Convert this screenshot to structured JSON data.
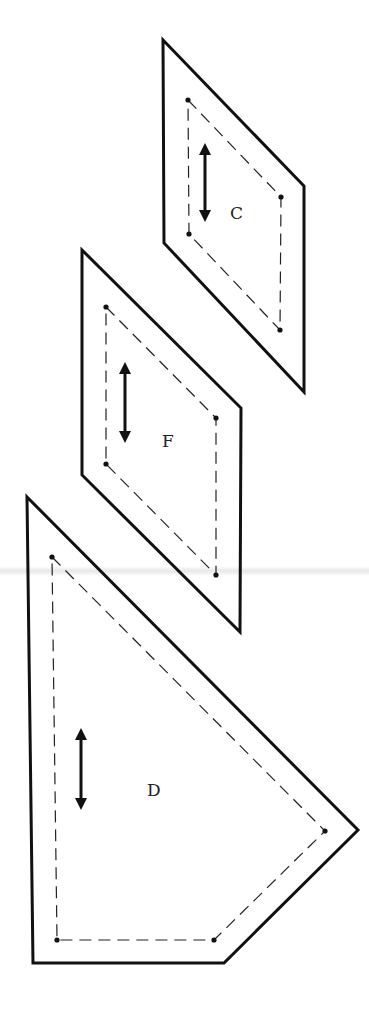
{
  "diagram": {
    "type": "quilt-pattern-templates",
    "background": "#ffffff",
    "line_color": "#111111",
    "pieces": [
      {
        "id": "C",
        "label": "C",
        "cut_line": [
          [
            163,
            40
          ],
          [
            304,
            186
          ],
          [
            304,
            392
          ],
          [
            164,
            243
          ]
        ],
        "seam_line": [
          [
            188,
            100
          ],
          [
            281,
            197
          ],
          [
            280,
            330
          ],
          [
            189,
            234
          ]
        ],
        "grain_arrow": {
          "x": 205,
          "y1": 143,
          "y2": 222
        },
        "label_pos": [
          230,
          219
        ]
      },
      {
        "id": "F",
        "label": "F",
        "cut_line": [
          [
            82,
            250
          ],
          [
            241,
            408
          ],
          [
            240,
            632
          ],
          [
            82,
            475
          ]
        ],
        "seam_line": [
          [
            106,
            307
          ],
          [
            216,
            418
          ],
          [
            216,
            575
          ],
          [
            106,
            464
          ]
        ],
        "grain_arrow": {
          "x": 125,
          "y1": 362,
          "y2": 443
        },
        "label_pos": [
          162,
          447
        ]
      },
      {
        "id": "D",
        "label": "D",
        "cut_line": [
          [
            27,
            497
          ],
          [
            358,
            830
          ],
          [
            224,
            963
          ],
          [
            33,
            963
          ]
        ],
        "seam_line": [
          [
            52,
            557
          ],
          [
            325,
            831
          ],
          [
            214,
            940
          ],
          [
            57,
            940
          ]
        ],
        "grain_arrow": {
          "x": 81,
          "y1": 728,
          "y2": 810
        },
        "label_pos": [
          147,
          796
        ]
      }
    ]
  }
}
